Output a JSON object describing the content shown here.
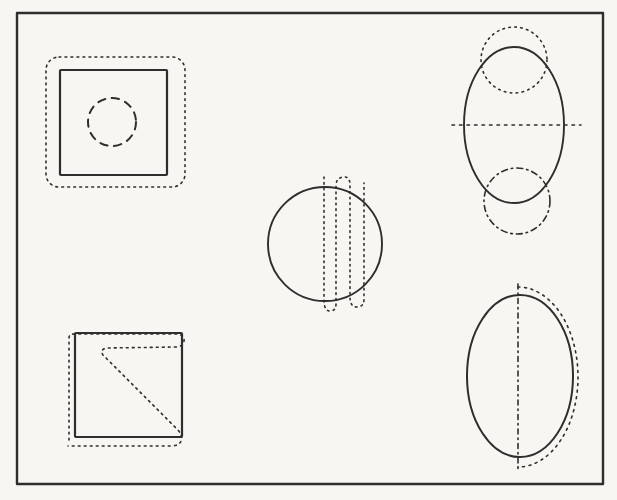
{
  "figure": {
    "canvas": {
      "width": 617,
      "height": 500
    },
    "paper_color": "#f7f6f2",
    "ink_color": "#2f2e2c",
    "border": {
      "name": "figure-border",
      "kind": "rect",
      "x": 17,
      "y": 13,
      "w": 586,
      "h": 471,
      "sw": 2.4,
      "dash": null
    },
    "shapes": [
      {
        "name": "topleft-dotted-rounded-square",
        "kind": "rect",
        "x": 46,
        "y": 57,
        "w": 139,
        "h": 130,
        "rx": 13,
        "sw": 1.6,
        "dash": "1.8 4.2"
      },
      {
        "name": "topleft-solid-square",
        "kind": "rect",
        "x": 60,
        "y": 70,
        "w": 107,
        "h": 105,
        "rx": 1,
        "sw": 2.2,
        "dash": null
      },
      {
        "name": "topleft-dashed-circle",
        "kind": "circle",
        "cx": 112,
        "cy": 122,
        "r": 24,
        "sw": 2,
        "dash": "7.5 6.5"
      },
      {
        "name": "center-solid-circle",
        "kind": "circle",
        "cx": 325,
        "cy": 244,
        "r": 57,
        "sw": 1.9,
        "dash": null
      },
      {
        "name": "center-dotted-vertical-scribble",
        "kind": "path",
        "d": "M324 177 L324 300 Q324 311 330 311 Q336 311 336 304 L336 186 Q336 178 343 177 Q350 176 350 185 L350 297 Q350 307 357 307 Q364 307 364 299 L364 183",
        "sw": 1.6,
        "dash": "1.6 4"
      },
      {
        "name": "topright-solid-ellipse",
        "kind": "ellipse",
        "cx": 514,
        "cy": 125,
        "rx": 50,
        "ry": 78,
        "sw": 1.9,
        "dash": null
      },
      {
        "name": "topright-dotted-circle",
        "kind": "circle",
        "cx": 514,
        "cy": 60,
        "r": 33,
        "sw": 1.6,
        "dash": "1.6 4.4"
      },
      {
        "name": "topright-dashdot-circle",
        "kind": "circle",
        "cx": 517,
        "cy": 201,
        "r": 33,
        "sw": 1.6,
        "dash": "6 4 1.5 4"
      },
      {
        "name": "topright-dotted-horizontal-line",
        "kind": "line",
        "x1": 452,
        "y1": 125,
        "x2": 581,
        "y2": 125,
        "sw": 1.6,
        "dash": "2.5 5"
      },
      {
        "name": "bottomleft-solid-square",
        "kind": "rect",
        "x": 75,
        "y": 333,
        "w": 107,
        "h": 104,
        "rx": 1,
        "sw": 2.2,
        "dash": null
      },
      {
        "name": "bottomleft-dotted-zigzag-scribble",
        "kind": "path",
        "d": "M69 440 L69 338 Q69 334 74 334 L177 334 Q185 335 184 341 Q183 347 175 347 L108 348 Q99 349 103 355 L178 430 Q183 436 181 441 Q179 446 170 446 L68 446",
        "sw": 1.6,
        "dash": "1.8 4.2"
      },
      {
        "name": "bottomright-solid-ellipse",
        "kind": "ellipse",
        "cx": 520,
        "cy": 376,
        "rx": 53,
        "ry": 81,
        "sw": 2,
        "dash": null
      },
      {
        "name": "bottomright-dashdot-vertical-line",
        "kind": "line",
        "x1": 518,
        "y1": 284,
        "x2": 518,
        "y2": 470,
        "sw": 1.6,
        "dash": "5 4 1.5 4"
      },
      {
        "name": "bottomright-dotted-right-arc",
        "kind": "path",
        "d": "M518 287 A60 90 0 0 1 518 467",
        "sw": 1.6,
        "dash": "2 4.6"
      }
    ]
  }
}
